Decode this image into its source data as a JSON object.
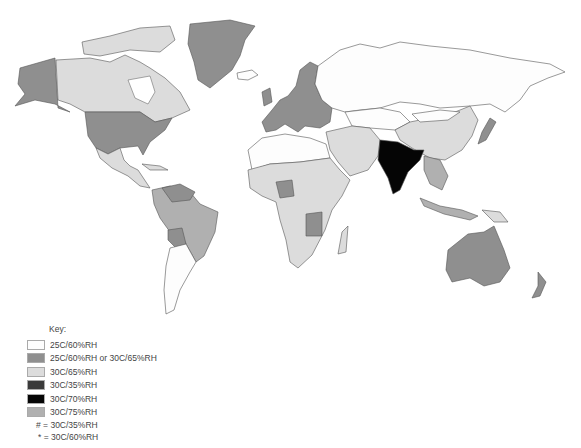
{
  "map": {
    "title": "World climatic zones for stability testing",
    "colors": {
      "z25_60": "#fdfdfd",
      "z25_60_or_30_65": "#8f8f8f",
      "z30_65": "#dcdcdc",
      "z30_35": "#3a3a3a",
      "z30_70": "#050505",
      "z30_75": "#b0b0b0"
    }
  },
  "legend": {
    "title": "Key:",
    "items": [
      {
        "label": "25C/60%RH",
        "color": "#fdfdfd"
      },
      {
        "label": "25C/60%RH or 30C/65%RH",
        "color": "#8f8f8f"
      },
      {
        "label": "30C/65%RH",
        "color": "#dcdcdc"
      },
      {
        "label": "30C/35%RH",
        "color": "#3a3a3a"
      },
      {
        "label": "30C/70%RH",
        "color": "#050505"
      },
      {
        "label": "30C/75%RH",
        "color": "#b0b0b0"
      }
    ],
    "notes": [
      {
        "symbol": "#",
        "text": "# = 30C/35%RH"
      },
      {
        "symbol": "*",
        "text": "* = 30C/60%RH"
      }
    ]
  }
}
